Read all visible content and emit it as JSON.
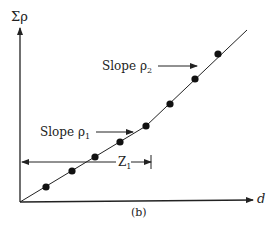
{
  "diagram": {
    "y_axis_label": "Σρ",
    "x_axis_label": "d",
    "caption": "(b)",
    "slope1_label": "Slope ρ",
    "slope1_sub": "1",
    "slope2_label": "Slope ρ",
    "slope2_sub": "2",
    "z_label": "Z",
    "z_sub": "1",
    "colors": {
      "ink": "#222222",
      "background": "#ffffff"
    },
    "points": [
      {
        "x": 46,
        "y": 187
      },
      {
        "x": 72,
        "y": 171
      },
      {
        "x": 95,
        "y": 157
      },
      {
        "x": 120,
        "y": 142
      },
      {
        "x": 146,
        "y": 126
      },
      {
        "x": 170,
        "y": 104
      },
      {
        "x": 195,
        "y": 79
      },
      {
        "x": 218,
        "y": 54
      }
    ]
  }
}
